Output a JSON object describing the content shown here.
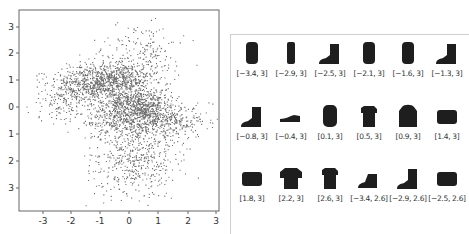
{
  "chart_data": [
    {
      "type": "scatter",
      "title": "",
      "xlabel": "",
      "ylabel": "",
      "xlim": [
        -3.8,
        3.1
      ],
      "ylim": [
        -3.8,
        3.5
      ],
      "x_ticks": [
        "-3",
        "-2",
        "-1",
        "0",
        "1",
        "2",
        "3"
      ],
      "y_ticks": [
        "3",
        "2",
        "1",
        "0",
        "1",
        "2",
        "3"
      ],
      "grid": false,
      "legend": null,
      "description": "Dense 2D latent-space point cloud (~5000 points) with several overlapping clusters: a band near y=1 from x=-2 to 1, a dense core around (0.7, 0), a band near y=-0.5 extending to x=2.7, and a diffuse region from y=-1 to -3.5 centered near x=0.",
      "clusters": [
        {
          "cx": -1.3,
          "cy": 0.9,
          "sx": 0.7,
          "sy": 0.35,
          "weight": 0.2
        },
        {
          "cx": -0.2,
          "cy": 1.1,
          "sx": 0.6,
          "sy": 0.3,
          "weight": 0.12
        },
        {
          "cx": 0.6,
          "cy": 0.0,
          "sx": 0.45,
          "sy": 0.35,
          "weight": 0.15
        },
        {
          "cx": -0.3,
          "cy": 0.2,
          "sx": 0.5,
          "sy": 0.3,
          "weight": 0.08
        },
        {
          "cx": 1.2,
          "cy": -0.5,
          "sx": 0.8,
          "sy": 0.3,
          "weight": 0.1
        },
        {
          "cx": -0.5,
          "cy": -0.5,
          "sx": 0.6,
          "sy": 0.3,
          "weight": 0.08
        },
        {
          "cx": 0.2,
          "cy": -1.8,
          "sx": 0.7,
          "sy": 0.8,
          "weight": 0.17
        },
        {
          "cx": 0.5,
          "cy": 2.0,
          "sx": 0.7,
          "sy": 0.5,
          "weight": 0.05
        },
        {
          "cx": -2.3,
          "cy": 0.2,
          "sx": 0.5,
          "sy": 0.4,
          "weight": 0.05
        }
      ]
    },
    {
      "type": "table",
      "title": "Decoded samples at latent coordinates",
      "cells": [
        {
          "label": "[−3.4, 3]",
          "item": "tall-boot"
        },
        {
          "label": "[−2.9, 3]",
          "item": "narrow-boot"
        },
        {
          "label": "[−2.5, 3]",
          "item": "ankle-boot"
        },
        {
          "label": "[−2.1, 3]",
          "item": "tall-boot"
        },
        {
          "label": "[−1.6, 3]",
          "item": "tall-boot"
        },
        {
          "label": "[−1.3, 3]",
          "item": "ankle-boot"
        },
        {
          "label": "[−0.8, 3]",
          "item": "ankle-boot"
        },
        {
          "label": "[−0.4, 3]",
          "item": "sneaker"
        },
        {
          "label": "[0.1, 3]",
          "item": "dress"
        },
        {
          "label": "[0.5, 3]",
          "item": "shirt"
        },
        {
          "label": "[0.9, 3]",
          "item": "coat"
        },
        {
          "label": "[1.4, 3]",
          "item": "bag"
        },
        {
          "label": "[1.8, 3]",
          "item": "bag"
        },
        {
          "label": "[2.2, 3]",
          "item": "tshirt"
        },
        {
          "label": "[2.6, 3]",
          "item": "shirt"
        },
        {
          "label": "[−3.4, 2.6]",
          "item": "sneaker-boot"
        },
        {
          "label": "[−2.9, 2.6]",
          "item": "ankle-boot"
        },
        {
          "label": "[−2.5, 2.6]",
          "item": "bag"
        }
      ]
    }
  ],
  "colors": {
    "point": "#222222",
    "axis": "#666666",
    "panel_border": "#cfcfcf",
    "thumbnail": "#1e1e1e"
  }
}
